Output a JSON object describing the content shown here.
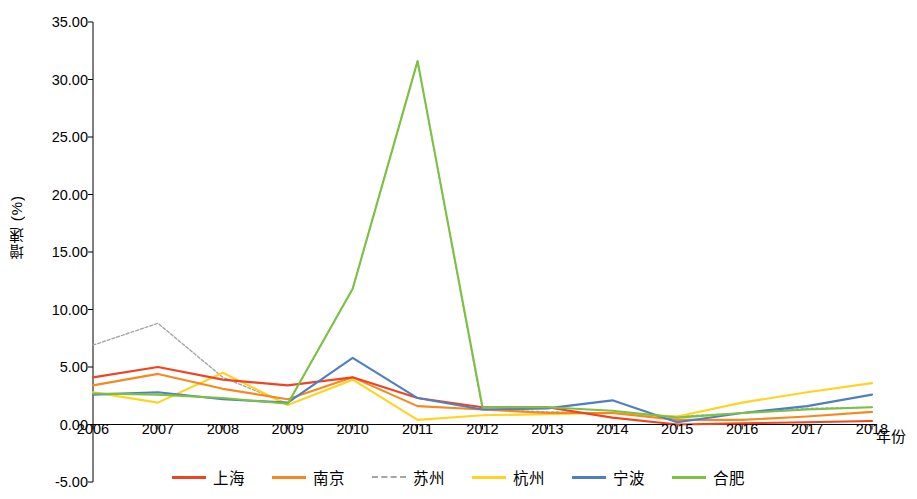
{
  "chart_data": {
    "type": "line",
    "title": "",
    "xlabel": "年份",
    "ylabel": "增速 (%)",
    "x": [
      "2006",
      "2007",
      "2008",
      "2009",
      "2010",
      "2011",
      "2012",
      "2013",
      "2014",
      "2015",
      "2016",
      "2017",
      "2018"
    ],
    "ylim": [
      -5.0,
      35.0
    ],
    "yticks": [
      "-5.00",
      "0.00",
      "5.00",
      "10.00",
      "15.00",
      "20.00",
      "25.00",
      "30.00",
      "35.00"
    ],
    "grid": false,
    "legend_position": "bottom",
    "series": [
      {
        "name": "上海",
        "color": "#ef4423",
        "values": [
          4.1,
          5.0,
          3.9,
          3.4,
          4.1,
          2.3,
          1.5,
          1.5,
          0.6,
          0.0,
          0.1,
          0.2,
          0.3
        ]
      },
      {
        "name": "南京",
        "color": "#f5891f",
        "values": [
          3.4,
          4.4,
          3.1,
          2.2,
          4.1,
          1.6,
          1.3,
          1.0,
          1.0,
          0.4,
          0.4,
          0.7,
          1.1
        ]
      },
      {
        "name": "苏州",
        "color": "#a6a6a6",
        "values": [
          6.9,
          8.8,
          4.1,
          1.8,
          11.8,
          31.6,
          1.3,
          1.1,
          1.0,
          0.7,
          1.0,
          1.4,
          1.5
        ]
      },
      {
        "name": "杭州",
        "color": "#ffd320",
        "values": [
          2.8,
          1.9,
          4.5,
          1.7,
          3.9,
          0.4,
          0.8,
          0.9,
          1.0,
          0.7,
          1.9,
          2.8,
          3.6
        ]
      },
      {
        "name": "宁波",
        "color": "#4f7fc0",
        "values": [
          2.6,
          2.8,
          2.2,
          1.9,
          5.8,
          2.3,
          1.3,
          1.4,
          2.1,
          0.2,
          1.0,
          1.6,
          2.6
        ]
      },
      {
        "name": "合肥",
        "color": "#7cc142",
        "values": [
          2.7,
          2.6,
          2.3,
          1.8,
          11.8,
          31.6,
          1.5,
          1.5,
          1.2,
          0.6,
          1.0,
          1.3,
          1.5
        ]
      }
    ]
  },
  "axis": {
    "ylabel": "增速 (%)",
    "xlabel": "年份"
  }
}
